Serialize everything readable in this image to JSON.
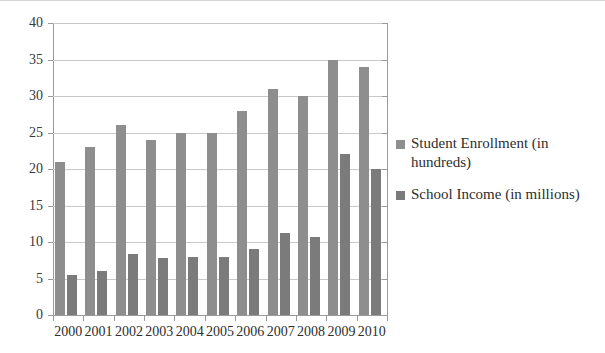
{
  "chart_data": {
    "type": "bar",
    "title": "",
    "xlabel": "",
    "ylabel": "",
    "categories": [
      "2000",
      "2001",
      "2002",
      "2003",
      "2004",
      "2005",
      "2006",
      "2007",
      "2008",
      "2009",
      "2010"
    ],
    "series": [
      {
        "name": "Student Enrollment (in hundreds)",
        "color": "#8e8e8e",
        "values": [
          21,
          23,
          26,
          24,
          25,
          25,
          28,
          31,
          30,
          35,
          34
        ]
      },
      {
        "name": "School Income (in millions)",
        "color": "#7b7b7b",
        "values": [
          5.5,
          6,
          8.3,
          7.8,
          8,
          7.9,
          9,
          11.2,
          10.7,
          22,
          20
        ]
      }
    ],
    "ylim": [
      0,
      40
    ],
    "ytick_labels": [
      "0",
      "5",
      "10",
      "15",
      "20",
      "25",
      "30",
      "35",
      "40"
    ],
    "ytick_values": [
      0,
      5,
      10,
      15,
      20,
      25,
      30,
      35,
      40
    ],
    "grid": "horizontal",
    "legend_position": "right"
  }
}
